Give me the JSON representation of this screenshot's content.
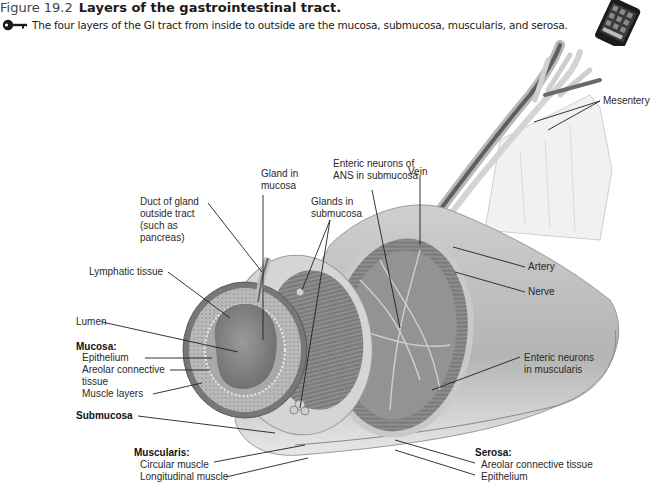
{
  "figure": {
    "number": "Figure 19.2",
    "title": "Layers of the gastrointestinal tract.",
    "key_concept": "The four layers of the GI tract from inside to outside are the mucosa, submucosa, muscularis, and serosa.",
    "icons": [
      "key-icon",
      "smartphone-icon"
    ]
  },
  "labels": {
    "mesentery": "Mesentery",
    "enteric_submucosa_1": "Enteric neurons of",
    "enteric_submucosa_2": "ANS in submucosa",
    "vein": "Vein",
    "gland_mucosa_1": "Gland in",
    "gland_mucosa_2": "mucosa",
    "glands_submucosa_1": "Glands in",
    "glands_submucosa_2": "submucosa",
    "duct_1": "Duct of gland",
    "duct_2": "outside tract",
    "duct_3": "(such as",
    "duct_4": "pancreas)",
    "lymphatic": "Lymphatic tissue",
    "artery": "Artery",
    "nerve": "Nerve",
    "lumen": "Lumen",
    "mucosa_heading": "Mucosa:",
    "mucosa_epithelium": "Epithelium",
    "mucosa_areolar_1": "Areolar connective",
    "mucosa_areolar_2": "tissue",
    "mucosa_muscle": "Muscle layers",
    "submucosa": "Submucosa",
    "enteric_muscularis_1": "Enteric neurons",
    "enteric_muscularis_2": "in muscularis",
    "muscularis_heading": "Muscularis:",
    "muscularis_circular": "Circular muscle",
    "muscularis_longitudinal": "Longitudinal muscle",
    "serosa_heading": "Serosa:",
    "serosa_areolar": "Areolar connective tissue",
    "serosa_epithelium": "Epithelium"
  }
}
